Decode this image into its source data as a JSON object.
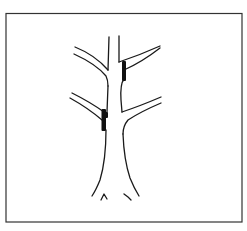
{
  "figure": {
    "colors": {
      "background": "#ffffff",
      "line": "#1a1a1a",
      "border": "#333333",
      "cut_mark": "#111111"
    },
    "elements": {
      "border": "frame-border",
      "trunk": "tree-trunk",
      "branches": [
        "upper-left-branch",
        "upper-right-branch",
        "lower-left-branch",
        "lower-right-branch"
      ],
      "leader": "central-leader",
      "cut_marks": [
        "upper-right-cut-mark",
        "lower-left-cut-mark"
      ],
      "root_flare_marks": 2
    }
  }
}
